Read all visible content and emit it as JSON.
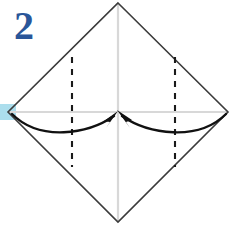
{
  "figure": {
    "step_label": "2",
    "step_label_color": "#2a5699",
    "background_color": "#ffffff"
  },
  "colors": {
    "outline": "#3b3b3b",
    "center_line": "#d8d8d8",
    "fold_line": "#1a1a1a",
    "arrow": "#111111",
    "highlight": "#a8dcec",
    "step_number": "#2a5699"
  },
  "shapes": {
    "diamond": {
      "name": "square-rotated-45",
      "top": [
        118,
        3
      ],
      "right": [
        228,
        112
      ],
      "bottom": [
        118,
        222
      ],
      "left": [
        8,
        112
      ],
      "stroke_width": 1.6
    },
    "center_lines": [
      {
        "name": "vertical-center-line",
        "from": [
          118,
          3
        ],
        "to": [
          118,
          222
        ]
      },
      {
        "name": "horizontal-center-line",
        "from": [
          8,
          112
        ],
        "to": [
          228,
          112
        ]
      }
    ],
    "fold_lines": [
      {
        "name": "left-fold-line",
        "x": 72,
        "from_y": 57,
        "to_y": 167,
        "dash": "6 6"
      },
      {
        "name": "right-fold-line",
        "x": 175,
        "from_y": 57,
        "to_y": 167,
        "dash": "6 6"
      }
    ],
    "arrows": [
      {
        "name": "left-fold-arrow",
        "direction": "left-to-center",
        "path": "M 12 114 C 40 142, 88 134, 114 116",
        "head_at": [
          116,
          115
        ]
      },
      {
        "name": "right-fold-arrow",
        "direction": "right-to-center",
        "path": "M 226 114 C 198 142, 148 134, 122 116",
        "head_at": [
          120,
          115
        ]
      }
    ],
    "highlight": {
      "name": "left-vertex-highlight",
      "x": 0,
      "y": 104,
      "width": 16,
      "height": 16
    }
  },
  "legend": {
    "dashed_meaning": "valley fold line",
    "arrow_meaning": "fold edge toward center"
  }
}
